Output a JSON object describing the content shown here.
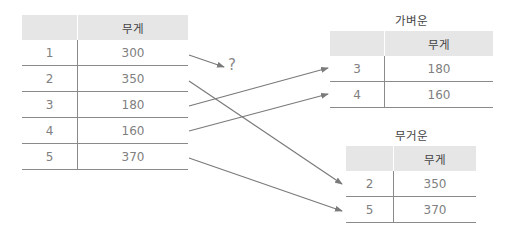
{
  "source_table": {
    "header": {
      "index": "",
      "weight": "무게"
    },
    "rows": [
      {
        "index": "1",
        "weight": "300"
      },
      {
        "index": "2",
        "weight": "350"
      },
      {
        "index": "3",
        "weight": "180"
      },
      {
        "index": "4",
        "weight": "160"
      },
      {
        "index": "5",
        "weight": "370"
      }
    ]
  },
  "unknown_marker": "?",
  "light_table": {
    "title": "가벼운",
    "header": {
      "index": "",
      "weight": "무게"
    },
    "rows": [
      {
        "index": "3",
        "weight": "180"
      },
      {
        "index": "4",
        "weight": "160"
      }
    ]
  },
  "heavy_table": {
    "title": "무거운",
    "header": {
      "index": "",
      "weight": "무게"
    },
    "rows": [
      {
        "index": "2",
        "weight": "350"
      },
      {
        "index": "5",
        "weight": "370"
      }
    ]
  },
  "colors": {
    "header_bg": "#e6e6e6",
    "line": "#8a8a8a",
    "arrow": "#7a7a7a"
  }
}
